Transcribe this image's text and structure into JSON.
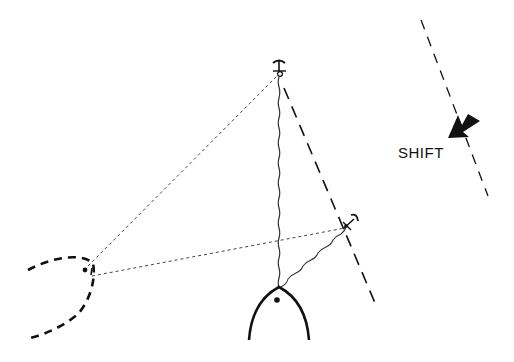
{
  "diagram": {
    "title": "",
    "labels": {
      "shift": "SHIFT"
    },
    "colors": {
      "ink": "#111111",
      "rope": "#333333",
      "background": "#ffffff"
    },
    "elements": [
      {
        "id": "boat-bow",
        "kind": "boat bow (pointed arc)",
        "apex": [
          279,
          287
        ]
      },
      {
        "id": "anchor-primary",
        "kind": "anchor",
        "position": [
          279,
          70
        ]
      },
      {
        "id": "anchor-secondary",
        "kind": "anchor",
        "position": [
          348,
          225
        ]
      },
      {
        "id": "shore-point",
        "kind": "shore tie-point",
        "position": [
          86,
          270
        ]
      },
      {
        "id": "shoreline",
        "kind": "dashed curved shoreline"
      },
      {
        "id": "wind-line-original",
        "kind": "long dashed line (original wind/current direction)"
      },
      {
        "id": "wind-line-shifted",
        "kind": "long dashed line (shifted direction)"
      },
      {
        "id": "shift-arrow",
        "kind": "thick arrow pointing toward dashed line",
        "label": "SHIFT"
      }
    ],
    "connections": [
      {
        "from": "boat-bow",
        "to": "anchor-primary",
        "style": "wavy rode"
      },
      {
        "from": "boat-bow",
        "to": "anchor-secondary",
        "style": "wavy rode"
      },
      {
        "from": "shore-point",
        "to": "anchor-primary",
        "style": "fine dotted line"
      },
      {
        "from": "shore-point",
        "to": "anchor-secondary",
        "style": "fine dotted line"
      }
    ]
  }
}
